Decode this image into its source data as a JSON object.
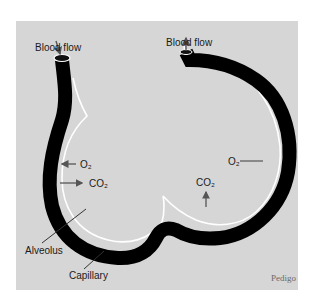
{
  "figure": {
    "labels": {
      "blood_flow_in": "Blood flow",
      "blood_flow_out": "Blood flow",
      "o2_left": "O₂",
      "co2_left": "CO₂",
      "o2_right": "O₂",
      "co2_bottom": "CO₂",
      "alveolus": "Alveolus",
      "capillary": "Capillary"
    },
    "credit": "Pedigo",
    "colors": {
      "background": "#d6d6d6",
      "capillary": "#000000",
      "alveolus_wall": "#ffffff",
      "arrow": "#555555",
      "text": "#1a1a1a"
    }
  }
}
